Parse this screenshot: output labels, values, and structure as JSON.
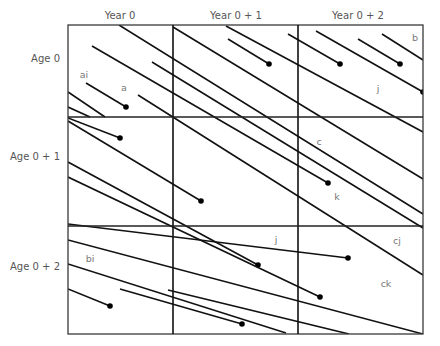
{
  "diagram": {
    "type": "lexis-diagram",
    "frame": {
      "x0": 68,
      "y0": 25,
      "x1": 423,
      "y1": 334
    },
    "vertical_dividers": [
      173,
      298
    ],
    "horizontal_dividers": [
      117,
      226
    ],
    "columns": [
      {
        "label": "Year 0",
        "x": 120
      },
      {
        "label": "Year 0 + 1",
        "x": 236
      },
      {
        "label": "Year 0 + 2",
        "x": 358
      }
    ],
    "rows": [
      {
        "label": "Age 0",
        "y": 58
      },
      {
        "label": "Age 0 + 1",
        "y": 156
      },
      {
        "label": "Age 0 + 2",
        "y": 266
      }
    ],
    "region_labels": [
      {
        "text": "ai",
        "x": 84,
        "y": 74
      },
      {
        "text": "a",
        "x": 124,
        "y": 87
      },
      {
        "text": "b",
        "x": 415,
        "y": 37
      },
      {
        "text": "j",
        "x": 378,
        "y": 88
      },
      {
        "text": "c",
        "x": 319,
        "y": 141
      },
      {
        "text": "k",
        "x": 337,
        "y": 196
      },
      {
        "text": "j",
        "x": 276,
        "y": 239
      },
      {
        "text": "cj",
        "x": 397,
        "y": 240
      },
      {
        "text": "bi",
        "x": 90,
        "y": 258
      },
      {
        "text": "ck",
        "x": 386,
        "y": 283
      }
    ],
    "life_lines": [
      {
        "x1": 119,
        "y1": 25,
        "x2": 423,
        "y2": 214,
        "death": false
      },
      {
        "x1": 92,
        "y1": 46,
        "x2": 328,
        "y2": 183,
        "death": true
      },
      {
        "x1": 86,
        "y1": 83,
        "x2": 126,
        "y2": 107,
        "death": true
      },
      {
        "x1": 138,
        "y1": 95,
        "x2": 423,
        "y2": 275,
        "death": false
      },
      {
        "x1": 152,
        "y1": 62,
        "x2": 423,
        "y2": 228,
        "death": false
      },
      {
        "x1": 68,
        "y1": 92,
        "x2": 105,
        "y2": 117,
        "death": false
      },
      {
        "x1": 68,
        "y1": 107,
        "x2": 90,
        "y2": 117,
        "death": false
      },
      {
        "x1": 173,
        "y1": 27,
        "x2": 423,
        "y2": 179,
        "death": false
      },
      {
        "x1": 226,
        "y1": 26,
        "x2": 423,
        "y2": 132,
        "death": false
      },
      {
        "x1": 228,
        "y1": 39,
        "x2": 269,
        "y2": 64,
        "death": true
      },
      {
        "x1": 288,
        "y1": 34,
        "x2": 340,
        "y2": 64,
        "death": true
      },
      {
        "x1": 316,
        "y1": 31,
        "x2": 423,
        "y2": 92,
        "death": true
      },
      {
        "x1": 358,
        "y1": 39,
        "x2": 400,
        "y2": 64,
        "death": true
      },
      {
        "x1": 382,
        "y1": 34,
        "x2": 423,
        "y2": 60,
        "death": false
      },
      {
        "x1": 68,
        "y1": 118,
        "x2": 120,
        "y2": 138,
        "death": true
      },
      {
        "x1": 68,
        "y1": 121,
        "x2": 201,
        "y2": 201,
        "death": true
      },
      {
        "x1": 68,
        "y1": 162,
        "x2": 258,
        "y2": 265,
        "death": true
      },
      {
        "x1": 68,
        "y1": 177,
        "x2": 320,
        "y2": 297,
        "death": true
      },
      {
        "x1": 68,
        "y1": 224,
        "x2": 348,
        "y2": 258,
        "death": true
      },
      {
        "x1": 68,
        "y1": 240,
        "x2": 423,
        "y2": 334,
        "death": false
      },
      {
        "x1": 68,
        "y1": 264,
        "x2": 286,
        "y2": 333,
        "death": false
      },
      {
        "x1": 68,
        "y1": 289,
        "x2": 110,
        "y2": 306,
        "death": true
      },
      {
        "x1": 120,
        "y1": 289,
        "x2": 242,
        "y2": 324,
        "death": true
      },
      {
        "x1": 168,
        "y1": 290,
        "x2": 349,
        "y2": 334,
        "death": false
      }
    ],
    "colors": {
      "frame": "#3a3a3a",
      "line": "#111111",
      "dot": "#000000",
      "label": "#555555"
    }
  }
}
